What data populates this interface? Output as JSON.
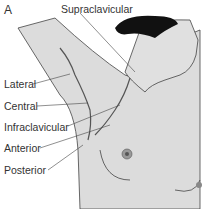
{
  "figure": {
    "panel_letter": "A",
    "colors": {
      "skin": "#dcdcdc",
      "line": "#444444",
      "hair": "#111111",
      "areola": "#888888"
    },
    "labels": [
      {
        "id": "supraclavicular",
        "text": "Supraclavicular"
      },
      {
        "id": "lateral",
        "text": "Lateral"
      },
      {
        "id": "central",
        "text": "Central"
      },
      {
        "id": "infraclavicular",
        "text": "Infraclavicular"
      },
      {
        "id": "anterior",
        "text": "Anterior"
      },
      {
        "id": "posterior",
        "text": "Posterior"
      }
    ]
  }
}
